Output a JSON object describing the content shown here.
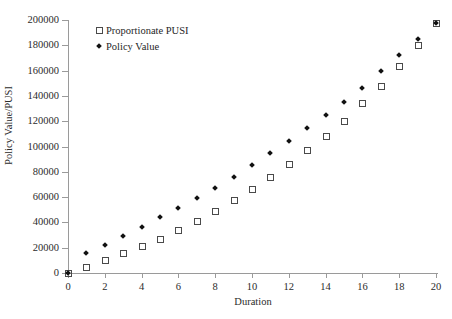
{
  "chart_data": {
    "type": "scatter",
    "title": "",
    "xlabel": "Duration",
    "ylabel": "Policy Value/PUSI",
    "xlim": [
      0,
      20
    ],
    "ylim": [
      0,
      200000
    ],
    "grid": false,
    "legend_position": "top-left",
    "x": [
      0,
      1,
      2,
      3,
      4,
      5,
      6,
      7,
      8,
      9,
      10,
      11,
      12,
      13,
      14,
      15,
      16,
      17,
      18,
      19,
      20
    ],
    "xticks": [
      0,
      2,
      4,
      6,
      8,
      10,
      12,
      14,
      16,
      18,
      20
    ],
    "xtick_labels": [
      "0",
      "2",
      "4",
      "6",
      "8",
      "10",
      "12",
      "14",
      "16",
      "18",
      "20"
    ],
    "yticks": [
      0,
      20000,
      40000,
      60000,
      80000,
      100000,
      120000,
      140000,
      160000,
      180000,
      200000
    ],
    "ytick_labels": [
      "0",
      "20000",
      "40000",
      "60000",
      "80000",
      "100000",
      "120000",
      "140000",
      "160000",
      "180000",
      "200000"
    ],
    "series": [
      {
        "name": "Proportionate PUSI",
        "marker": "open-square",
        "color": "#4a4a4a",
        "values": [
          0,
          5000,
          10000,
          15500,
          21000,
          27000,
          34000,
          41500,
          49000,
          57500,
          66500,
          76000,
          86500,
          97500,
          108500,
          120500,
          134000,
          148000,
          163500,
          180000,
          198000
        ]
      },
      {
        "name": "Policy Value",
        "marker": "filled-diamond",
        "color": "#111111",
        "values": [
          0,
          16000,
          22500,
          29000,
          36500,
          44000,
          51500,
          59500,
          67500,
          76000,
          85000,
          94500,
          104500,
          114500,
          125000,
          135000,
          146500,
          159500,
          172000,
          185000,
          198000
        ]
      }
    ]
  },
  "legend": {
    "items": [
      {
        "label": "Proportionate PUSI",
        "marker": "open-square"
      },
      {
        "label": "Policy Value",
        "marker": "filled-diamond"
      }
    ]
  }
}
